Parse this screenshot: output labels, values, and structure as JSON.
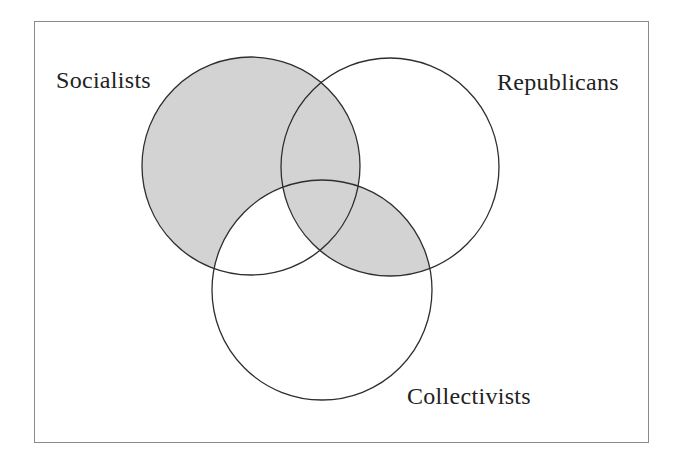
{
  "diagram": {
    "type": "venn",
    "sets": [
      {
        "id": "S",
        "label": "Socialists",
        "cx": 251,
        "cy": 166,
        "r": 109
      },
      {
        "id": "R",
        "label": "Republicans",
        "cx": 390,
        "cy": 167,
        "r": 109
      },
      {
        "id": "C",
        "label": "Collectivists",
        "cx": 322,
        "cy": 290,
        "r": 110
      }
    ],
    "shaded_regions": [
      "S only",
      "S∩R only",
      "S∩R∩C",
      "R∩C only"
    ],
    "unshaded_regions": [
      "R only",
      "C only",
      "S∩C only"
    ],
    "colors": {
      "fill": "#d3d3d3",
      "stroke": "#2e2e2e",
      "frame": "#8a8a8a",
      "text": "#222222"
    }
  },
  "labels": {
    "socialists": "Socialists",
    "republicans": "Republicans",
    "collectivists": "Collectivists"
  }
}
